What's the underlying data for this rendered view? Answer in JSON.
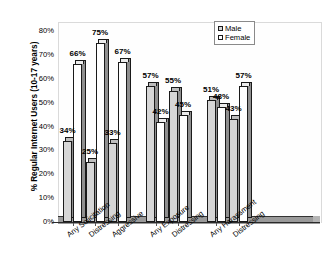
{
  "chart_data": {
    "type": "bar",
    "title": "",
    "xlabel": "",
    "ylabel": "% Regular Internet Users (10-17 years)",
    "ylim": [
      0,
      80
    ],
    "ytick_labels": [
      "0%",
      "10%",
      "20%",
      "30%",
      "40%",
      "50%",
      "60%",
      "70%",
      "80%"
    ],
    "ytick_values": [
      0,
      10,
      20,
      30,
      40,
      50,
      60,
      70,
      80
    ],
    "grid": false,
    "legend_position": "top-right",
    "categories": [
      "Any Solicitation",
      "Distressing",
      "Aggressive",
      "Any Exposure",
      "Distressing",
      "Any Harassment",
      "Distressing"
    ],
    "groups": [
      {
        "name": "Solicitation",
        "categories": [
          "Any Solicitation",
          "Distressing",
          "Aggressive"
        ]
      },
      {
        "name": "Exposure",
        "categories": [
          "Any Exposure",
          "Distressing"
        ]
      },
      {
        "name": "Harassment",
        "categories": [
          "Any Harassment",
          "Distressing"
        ]
      }
    ],
    "series": [
      {
        "name": "Male",
        "color": "#d6d6d6",
        "values": [
          34,
          25,
          33,
          57,
          55,
          51,
          43
        ],
        "labels": [
          "34%",
          "25%",
          "33%",
          "57%",
          "55%",
          "51%",
          "43%"
        ]
      },
      {
        "name": "Female",
        "color": "#ffffff",
        "values": [
          66,
          75,
          67,
          42,
          45,
          48,
          57
        ],
        "labels": [
          "66%",
          "75%",
          "67%",
          "42%",
          "45%",
          "48%",
          "57%"
        ]
      }
    ]
  },
  "legend": {
    "items": [
      {
        "label": "Male",
        "swatch": "male"
      },
      {
        "label": "Female",
        "swatch": "female"
      }
    ]
  }
}
